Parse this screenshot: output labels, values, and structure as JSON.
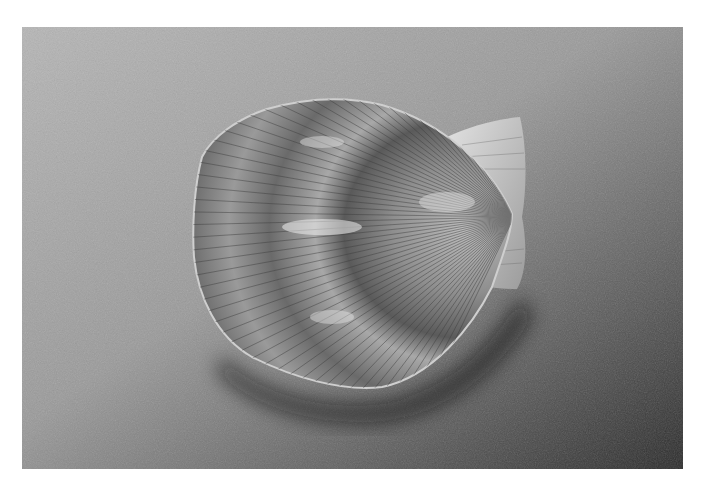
{
  "image": {
    "subject": "Scallop shell on sand",
    "description": "Black and white photograph of a fan-shaped scallop shell with radial ribs and concentric growth bands resting on a sandy surface",
    "colors": {
      "sand_light": "#b4b4b4",
      "sand_dark": "#2e2e2e",
      "shell_light": "#d8d8d8",
      "shell_mid": "#8c8c8c",
      "shell_dark": "#4a4a4a",
      "background": "#ffffff"
    }
  }
}
